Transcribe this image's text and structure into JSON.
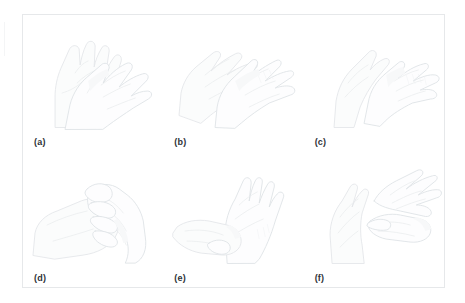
{
  "figure": {
    "border_color": "#e6e8ea",
    "background_color": "#ffffff",
    "label_color": "#2e3338",
    "line_color": "#dfe3e6",
    "columns": 3,
    "rows": 2,
    "panels": [
      {
        "id": "a",
        "label": "(a)",
        "step_name": "palm-to-palm",
        "description": "Right palm rubbed over left palm"
      },
      {
        "id": "b",
        "label": "(b)",
        "step_name": "palm-over-dorsum",
        "description": "Palm over the back of the other hand with fingers spread"
      },
      {
        "id": "c",
        "label": "(c)",
        "step_name": "palm-to-palm-fingers-interlaced",
        "description": "Palm to palm with fingers interlaced"
      },
      {
        "id": "d",
        "label": "(d)",
        "step_name": "backs-of-fingers-to-opposing-palms",
        "description": "Backs of fingers to opposing palms with fingers interlocked"
      },
      {
        "id": "e",
        "label": "(e)",
        "step_name": "rotational-rubbing-of-thumb",
        "description": "Rotational rubbing of the thumb clasped in the opposite palm"
      },
      {
        "id": "f",
        "label": "(f)",
        "step_name": "rotational-rubbing-of-fingertips",
        "description": "Rotational rubbing of clasped fingertips in the opposite palm"
      }
    ]
  }
}
